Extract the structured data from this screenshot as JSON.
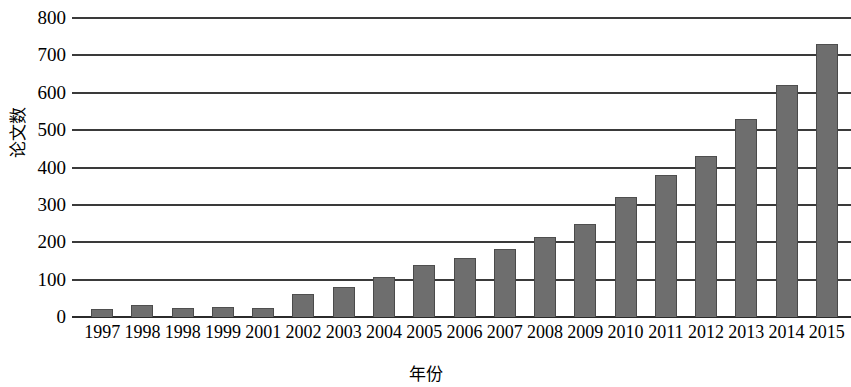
{
  "chart_data": {
    "type": "bar",
    "title": "",
    "subtitle": "",
    "xlabel": "年份",
    "ylabel": "论文数",
    "categories": [
      "1997",
      "1998",
      "1998",
      "1999",
      "2001",
      "2002",
      "2003",
      "2004",
      "2005",
      "2006",
      "2007",
      "2008",
      "2009",
      "2010",
      "2011",
      "2012",
      "2013",
      "2014",
      "2015"
    ],
    "values": [
      22,
      33,
      25,
      28,
      25,
      62,
      80,
      107,
      140,
      158,
      182,
      215,
      250,
      320,
      380,
      432,
      530,
      620,
      730
    ],
    "series": [
      {
        "name": "论文数",
        "values": [
          22,
          33,
          25,
          28,
          25,
          62,
          80,
          107,
          140,
          158,
          182,
          215,
          250,
          320,
          380,
          432,
          530,
          620,
          730
        ]
      }
    ],
    "ylim": [
      0,
      800
    ],
    "y_ticks": [
      "0",
      "100",
      "200",
      "300",
      "400",
      "500",
      "600",
      "700",
      "800"
    ],
    "y_tick_values": [
      0,
      100,
      200,
      300,
      400,
      500,
      600,
      700,
      800
    ],
    "grid": true,
    "legend": false,
    "legend_position": "none",
    "orientation": "vertical",
    "bar_color": "#6e6e6e",
    "grid_color": "#3a3a3a",
    "axis_color": "#2b2b2b",
    "background_color": "#ffffff"
  }
}
